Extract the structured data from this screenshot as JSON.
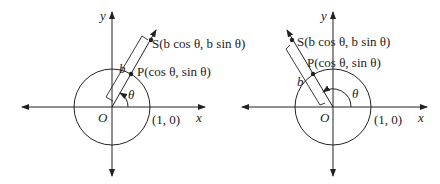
{
  "figures": [
    {
      "id": "left",
      "axis_x_label": "x",
      "axis_y_label": "y",
      "origin_label": "O",
      "unit_point_label": "(1, 0)",
      "angle_label": "θ",
      "length_label": "b",
      "point_P_label": "P(cos θ, sin θ)",
      "point_S_label": "S(b cos θ, b sin θ)",
      "angle_deg": 60
    },
    {
      "id": "right",
      "axis_x_label": "x",
      "axis_y_label": "y",
      "origin_label": "O",
      "unit_point_label": "(1, 0)",
      "angle_label": "θ",
      "length_label": "b",
      "point_P_label": "P(cos θ, sin θ)",
      "point_S_label": "S(b cos θ, b sin θ)",
      "angle_deg": 120
    }
  ]
}
